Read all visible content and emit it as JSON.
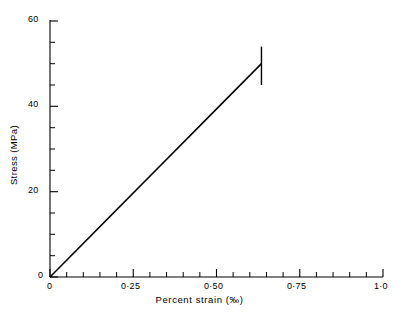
{
  "chart_data": {
    "type": "line",
    "title": "",
    "xlabel": "Percent strain (‰)",
    "ylabel": "Stress (MPa)",
    "xlim": [
      0,
      1.0
    ],
    "ylim": [
      0,
      60
    ],
    "grid": false,
    "legend": null,
    "x_ticks_major": [
      0,
      0.25,
      0.5,
      0.75,
      1.0
    ],
    "x_tick_labels": [
      "0",
      "0·25",
      "0·50",
      "0·75",
      "1·0"
    ],
    "x_tick_minor_step": 0.05,
    "y_ticks_major": [
      0,
      20,
      40,
      60
    ],
    "y_tick_labels": [
      "0",
      "20",
      "40",
      "60"
    ],
    "y_tick_minor_step": 5,
    "series": [
      {
        "name": "stress-strain",
        "x": [
          0,
          0.635
        ],
        "y": [
          0,
          50
        ]
      }
    ],
    "annotations": [
      {
        "name": "fracture-marker",
        "type": "vertical-bar",
        "x": 0.635,
        "y_from": 45.0,
        "y_to": 54.0
      }
    ],
    "axis_color": "#000000",
    "line_color": "#000000"
  },
  "labels": {
    "x_axis_title": "Percent strain (‰)",
    "y_axis_title": "Stress (MPa)"
  }
}
